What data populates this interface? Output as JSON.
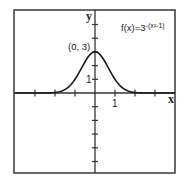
{
  "chart_data": {
    "type": "line",
    "title": "",
    "function_label": "f(x)=3^-(x²-1)",
    "function_label_base": "f(x)=3",
    "function_label_exponent": "-(x²-1)",
    "xlabel": "x",
    "ylabel": "y",
    "xlim": [
      -4,
      4
    ],
    "ylim": [
      -6,
      6
    ],
    "grid": false,
    "legend": null,
    "x_tick_values": [
      -3,
      -2,
      -1,
      1,
      2,
      3
    ],
    "y_tick_values": [
      -5,
      -4,
      -3,
      -2,
      -1,
      1,
      2,
      3,
      4,
      5
    ],
    "x_tick_labels": [
      {
        "value": 1,
        "label": "1"
      }
    ],
    "y_tick_labels": [
      {
        "value": 1,
        "label": "1"
      }
    ],
    "annotations": [
      {
        "x": 0,
        "y": 3,
        "text": "(0, 3)"
      }
    ],
    "series": [
      {
        "name": "f(x)=3^-(x²-1)",
        "x": [
          -4,
          -3,
          -2.5,
          -2,
          -1.5,
          -1,
          -0.75,
          -0.5,
          -0.25,
          0,
          0.25,
          0.5,
          0.75,
          1,
          1.5,
          2,
          2.5,
          3,
          4
        ],
        "y": [
          0.0,
          0.0,
          0.003,
          0.037,
          0.253,
          1.0,
          1.617,
          2.28,
          2.803,
          3.0,
          2.803,
          2.28,
          1.617,
          1.0,
          0.253,
          0.037,
          0.003,
          0.0,
          0.0
        ]
      }
    ]
  },
  "colors": {
    "axis": "#333333",
    "curve": "#1a1a1a",
    "frame": "#444444",
    "background": "#ffffff"
  }
}
